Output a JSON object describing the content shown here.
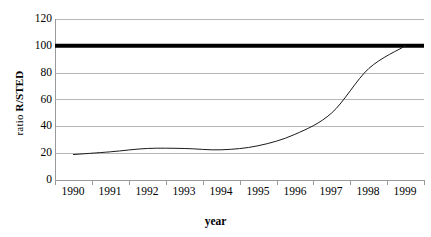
{
  "chart_data": {
    "type": "line",
    "title": "",
    "xlabel": "year",
    "ylabel": "ratio R/STED",
    "ylabel_parts": {
      "normal": "ratio ",
      "bold": "R/STED"
    },
    "categories": [
      "1990",
      "1991",
      "1992",
      "1993",
      "1994",
      "1995",
      "1996",
      "1997",
      "1998",
      "1999"
    ],
    "ytick_labels": [
      "120",
      "100",
      "80",
      "60",
      "40",
      "20",
      "0"
    ],
    "yticks": [
      0,
      20,
      40,
      60,
      80,
      100,
      120
    ],
    "ylim": [
      0,
      120
    ],
    "grid": true,
    "legend": "none",
    "series": [
      {
        "name": "ratio R/STED",
        "color": "#1a1a1a",
        "line_width": 1,
        "values": [
          19,
          21,
          23.5,
          23.5,
          22.5,
          25.5,
          34,
          50,
          83,
          100
        ]
      },
      {
        "name": "reference level 100",
        "type": "hline",
        "color": "#000000",
        "line_width": 4,
        "value": 100
      }
    ]
  }
}
